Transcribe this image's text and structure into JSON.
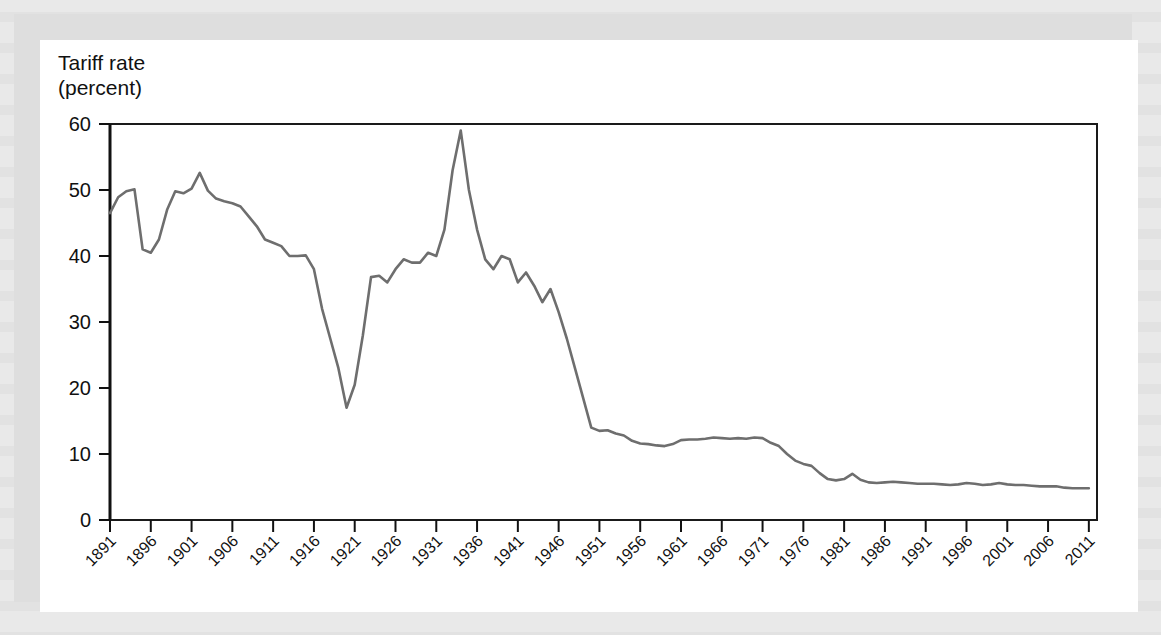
{
  "figure": {
    "axis_title_line1": "Tariff rate",
    "axis_title_line2": "(percent)"
  },
  "chart_data": {
    "type": "line",
    "title": "",
    "xlabel": "",
    "ylabel": "Tariff rate (percent)",
    "ylim": [
      0,
      60
    ],
    "xlim": [
      1891,
      2012
    ],
    "yticks": [
      0,
      10,
      20,
      30,
      40,
      50,
      60
    ],
    "xticks": [
      1891,
      1896,
      1901,
      1906,
      1911,
      1916,
      1921,
      1926,
      1931,
      1936,
      1941,
      1946,
      1951,
      1956,
      1961,
      1966,
      1971,
      1976,
      1981,
      1986,
      1991,
      1996,
      2001,
      2006,
      2011
    ],
    "grid": false,
    "legend": null,
    "line_color": "#6e6e6e",
    "series": [
      {
        "name": "Average U.S. tariff rate on dutiable imports",
        "x": [
          1891,
          1892,
          1893,
          1894,
          1895,
          1896,
          1897,
          1898,
          1899,
          1900,
          1901,
          1902,
          1903,
          1904,
          1905,
          1906,
          1907,
          1908,
          1909,
          1910,
          1911,
          1912,
          1913,
          1914,
          1915,
          1916,
          1917,
          1918,
          1919,
          1920,
          1921,
          1922,
          1923,
          1924,
          1925,
          1926,
          1927,
          1928,
          1929,
          1930,
          1931,
          1932,
          1933,
          1934,
          1935,
          1936,
          1937,
          1938,
          1939,
          1940,
          1941,
          1942,
          1943,
          1944,
          1945,
          1946,
          1947,
          1948,
          1949,
          1950,
          1951,
          1952,
          1953,
          1954,
          1955,
          1956,
          1957,
          1958,
          1959,
          1960,
          1961,
          1962,
          1963,
          1964,
          1965,
          1966,
          1967,
          1968,
          1969,
          1970,
          1971,
          1972,
          1973,
          1974,
          1975,
          1976,
          1977,
          1978,
          1979,
          1980,
          1981,
          1982,
          1983,
          1984,
          1985,
          1986,
          1987,
          1988,
          1989,
          1990,
          1991,
          1992,
          1993,
          1994,
          1995,
          1996,
          1997,
          1998,
          1999,
          2000,
          2001,
          2002,
          2003,
          2004,
          2005,
          2006,
          2007,
          2008,
          2009,
          2010,
          2011
        ],
        "y": [
          46.5,
          48.9,
          49.8,
          50.1,
          41.0,
          40.5,
          42.5,
          47.0,
          49.8,
          49.5,
          50.2,
          52.6,
          49.9,
          48.7,
          48.3,
          48.0,
          47.5,
          46.0,
          44.5,
          42.5,
          42.0,
          41.5,
          40.0,
          40.0,
          40.1,
          38.0,
          32.0,
          27.5,
          23.0,
          17.0,
          20.5,
          28.0,
          36.8,
          37.0,
          36.0,
          38.0,
          39.5,
          39.0,
          39.0,
          40.5,
          40.0,
          44.0,
          53.0,
          59.0,
          50.0,
          44.0,
          39.5,
          38.0,
          40.0,
          39.5,
          36.0,
          37.5,
          35.5,
          33.0,
          35.0,
          31.5,
          27.5,
          23.0,
          18.5,
          14.0,
          13.5,
          13.6,
          13.1,
          12.8,
          12.0,
          11.6,
          11.5,
          11.3,
          11.2,
          11.5,
          12.1,
          12.2,
          12.2,
          12.3,
          12.5,
          12.4,
          12.3,
          12.4,
          12.3,
          12.5,
          12.4,
          11.7,
          11.2,
          10.0,
          9.0,
          8.5,
          8.2,
          7.1,
          6.2,
          6.0,
          6.2,
          7.0,
          6.1,
          5.7,
          5.6,
          5.7,
          5.8,
          5.7,
          5.6,
          5.5,
          5.5,
          5.5,
          5.4,
          5.3,
          5.4,
          5.6,
          5.5,
          5.3,
          5.4,
          5.6,
          5.4,
          5.3,
          5.3,
          5.2,
          5.1,
          5.1,
          5.1,
          4.9,
          4.8,
          4.8,
          4.8
        ]
      }
    ]
  }
}
